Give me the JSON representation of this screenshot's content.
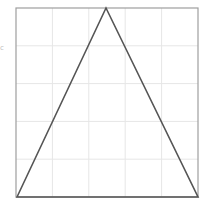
{
  "diagram": {
    "type": "geometry",
    "shape": "isosceles-triangle",
    "frame": {
      "x": 16,
      "y": 8,
      "width": 182,
      "height": 189,
      "stroke": "#9e9e9e"
    },
    "grid": {
      "columns": 5,
      "rows": 5,
      "stroke": "#e6e6e6"
    },
    "triangle": {
      "points": [
        [
          17,
          197
        ],
        [
          106,
          8
        ],
        [
          198,
          197
        ]
      ],
      "stroke": "#555555",
      "stroke_width": 1.6
    },
    "side_label": "c"
  }
}
